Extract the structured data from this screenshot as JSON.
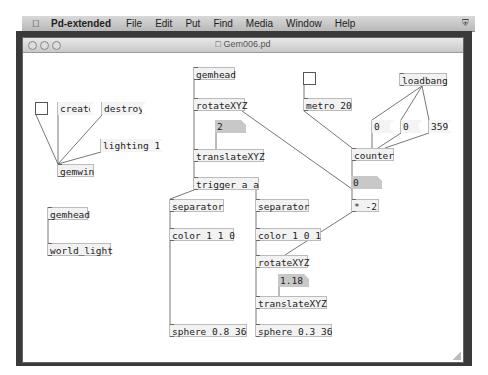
{
  "menubar": {
    "app_name": "Pd-extended",
    "items": [
      "File",
      "Edit",
      "Put",
      "Find",
      "Media",
      "Window",
      "Help"
    ],
    "apple_icon": "apple-icon",
    "tray_icon": "shield-icon"
  },
  "window": {
    "title": "Gem006.pd",
    "traffic_lights": [
      "close",
      "minimize",
      "zoom"
    ]
  },
  "patch": {
    "objects": {
      "gemwin": "gemwin",
      "gemhead_left": "gemhead",
      "world_light": "world_light",
      "gemhead_main": "gemhead",
      "rotate1": "rotateXYZ",
      "translate1": "translateXYZ",
      "trigger": "trigger a a",
      "separator1": "separator",
      "separator2": "separator",
      "color1": "color 1 1 0",
      "color2": "color 1 0 1",
      "rotate2": "rotateXYZ",
      "translate2": "translateXYZ",
      "sphere1": "sphere 0.8 36",
      "sphere2": "sphere 0.3 36",
      "metro": "metro 20",
      "loadbang": "loadbang",
      "counter": "counter",
      "multiply": "* -2"
    },
    "messages": {
      "create": "create",
      "destroy": "destroy",
      "lighting": "lighting 1",
      "zero_a": "0",
      "zero_b": "0",
      "max": "359"
    },
    "numbers": {
      "translate_y": "2",
      "counter_out": "0",
      "translate2_x": "1.18"
    }
  }
}
